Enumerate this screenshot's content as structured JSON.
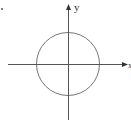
{
  "diagram": {
    "type": "coordinate-plane-with-circle",
    "axes": {
      "x_label": "x",
      "y_label": "y"
    },
    "circle": {
      "center": [
        0,
        0
      ],
      "shape": "circle centered at origin"
    },
    "colors": {
      "axis": "#555555",
      "circle": "#777777"
    },
    "marker": "."
  }
}
